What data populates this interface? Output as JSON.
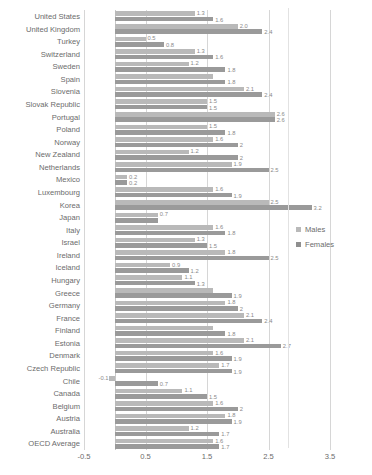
{
  "chart_data": {
    "type": "bar",
    "orientation": "horizontal",
    "title": "",
    "subtitle": "",
    "xlabel": "",
    "ylabel": "",
    "xlim": [
      -0.5,
      3.5
    ],
    "xticks": [
      "-0.5",
      "0.5",
      "1.5",
      "2.5",
      "3.5"
    ],
    "xtick_values": [
      -0.5,
      0.5,
      1.5,
      2.5,
      3.5
    ],
    "grid": true,
    "grid_axis": "x",
    "legend_position": "right",
    "legend": [
      "Males",
      "Females"
    ],
    "colors": {
      "males": "#b9b9b9",
      "females": "#9a9a9a",
      "grid": "#d6d6d6",
      "text": "#6b6b6b"
    },
    "categories": [
      "United States",
      "United Kingdom",
      "Turkey",
      "Switzerland",
      "Sweden",
      "Spain",
      "Slovenia",
      "Slovak Republic",
      "Portugal",
      "Poland",
      "Norway",
      "New Zealand",
      "Netherlands",
      "Mexico",
      "Luxembourg",
      "Korea",
      "Japan",
      "Italy",
      "Israel",
      "Ireland",
      "Iceland",
      "Hungary",
      "Greece",
      "Germany",
      "France",
      "Finland",
      "Estonia",
      "Denmark",
      "Czech Republic",
      "Chile",
      "Canada",
      "Belgium",
      "Austria",
      "Australia",
      "OECD Average"
    ],
    "series": [
      {
        "name": "Males",
        "values": [
          1.3,
          2.0,
          0.5,
          1.3,
          1.2,
          1.6,
          2.1,
          1.5,
          2.6,
          1.5,
          1.6,
          1.2,
          1.9,
          0.2,
          1.6,
          2.5,
          0.7,
          1.6,
          1.3,
          1.8,
          0.9,
          1.1,
          1.6,
          1.8,
          2.1,
          1.6,
          2.1,
          1.6,
          1.7,
          -0.1,
          1.1,
          1.6,
          1.8,
          1.2,
          1.6
        ],
        "labels": [
          "1.3",
          "2.0",
          "0.5",
          "1.3",
          "1.2",
          "",
          "2.1",
          "1.5",
          "2.6",
          "1.5",
          "1.6",
          "1.2",
          "1.9",
          "0.2",
          "1.6",
          "2.5",
          "0.7",
          "1.6",
          "1.3",
          "1.8",
          "0.9",
          "1.1",
          "",
          "1.8",
          "2.1",
          "",
          "2.1",
          "1.6",
          "1.7",
          "-0.1",
          "1.1",
          "1.6",
          "1.8",
          "1.2",
          "1.6"
        ]
      },
      {
        "name": "Females",
        "values": [
          1.6,
          2.4,
          0.8,
          1.6,
          1.8,
          1.8,
          2.4,
          1.5,
          2.6,
          1.8,
          2.0,
          2.0,
          2.5,
          0.2,
          1.9,
          3.2,
          0.7,
          1.8,
          1.5,
          2.5,
          1.2,
          1.3,
          1.9,
          2.0,
          2.4,
          1.8,
          2.7,
          1.9,
          1.9,
          0.7,
          1.5,
          2.0,
          1.9,
          1.7,
          1.7
        ],
        "labels": [
          "1.6",
          "2.4",
          "0.8",
          "1.6",
          "1.8",
          "1.8",
          "2.4",
          "1.5",
          "2.6",
          "1.8",
          "2",
          "2",
          "2.5",
          "0.2",
          "1.9",
          "3.2",
          "",
          "1.8",
          "1.5",
          "2.5",
          "1.2",
          "1.3",
          "1.9",
          "2",
          "2.4",
          "1.8",
          "2.7",
          "1.9",
          "1.9",
          "0.7",
          "1.5",
          "2",
          "1.9",
          "1.7",
          "1.7"
        ]
      }
    ]
  }
}
